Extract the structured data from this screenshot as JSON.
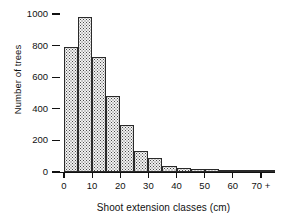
{
  "chart_data": {
    "type": "bar",
    "title": "",
    "subtitle": "",
    "xlabel": "Shoot extension classes (cm)",
    "ylabel": "Number of trees",
    "grid": false,
    "legend": false,
    "legend_position": "none",
    "bin_width": 5,
    "xlim": [
      0,
      75
    ],
    "ylim": [
      0,
      1000
    ],
    "x_tick_labels": [
      "0",
      "10",
      "20",
      "30",
      "40",
      "50",
      "60",
      "70 +"
    ],
    "x_tick_values": [
      0,
      10,
      20,
      30,
      40,
      50,
      60,
      70
    ],
    "y_tick_labels": [
      "0",
      "200",
      "400",
      "600",
      "800",
      "1000"
    ],
    "y_tick_values": [
      0,
      200,
      400,
      600,
      800,
      1000
    ],
    "categories": [
      "0-5",
      "5-10",
      "10-15",
      "15-20",
      "20-25",
      "25-30",
      "30-35",
      "35-40",
      "40-45",
      "45-50",
      "50-55",
      "55-60",
      "60-65",
      "65-70",
      "70-75",
      "75+"
    ],
    "bin_starts": [
      0,
      5,
      10,
      15,
      20,
      25,
      30,
      35,
      40,
      45,
      50,
      55,
      60,
      65,
      70,
      75
    ],
    "values": [
      790,
      980,
      730,
      480,
      300,
      130,
      90,
      40,
      25,
      22,
      20,
      8,
      5,
      5,
      5,
      5
    ],
    "series": [
      {
        "name": "Number of trees",
        "values": [
          790,
          980,
          730,
          480,
          300,
          130,
          90,
          40,
          25,
          22,
          20,
          8,
          5,
          5,
          5,
          5
        ]
      }
    ]
  },
  "style": {
    "bar_fill": "#f2f2f2",
    "bar_dot_color": "#4a4a4a",
    "bar_edge": "#2a2a2a",
    "axis_color": "#111111",
    "background": "#ffffff"
  }
}
